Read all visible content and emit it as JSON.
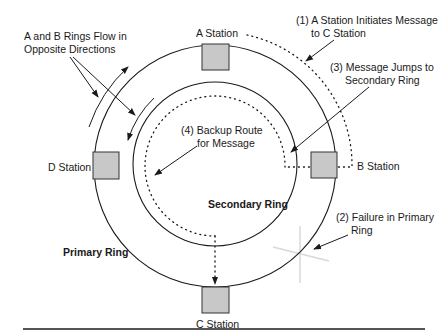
{
  "diagram": {
    "colors": {
      "line": "#1a1a1a",
      "station_fill": "#c8c8c8",
      "station_stroke": "#333333",
      "rule": "#555555"
    },
    "rings": {
      "primary_label": "Primary Ring",
      "secondary_label": "Secondary Ring"
    },
    "stations": [
      {
        "id": "A",
        "label": "A Station"
      },
      {
        "id": "B",
        "label": "B Station"
      },
      {
        "id": "C",
        "label": "C Station"
      },
      {
        "id": "D",
        "label": "D Station"
      }
    ],
    "annotations": {
      "flow_line1": "A and B Rings Flow in",
      "flow_line2": "Opposite Directions",
      "step1_line1": "(1) A Station Initiates Message",
      "step1_line2": "to C Station",
      "step2_line1": "(2) Failure in Primary",
      "step2_line2": "Ring",
      "step3_line1": "(3) Message Jumps to",
      "step3_line2": "Secondary Ring",
      "step4_line1": "(4) Backup Route",
      "step4_line2": "for Message"
    }
  }
}
